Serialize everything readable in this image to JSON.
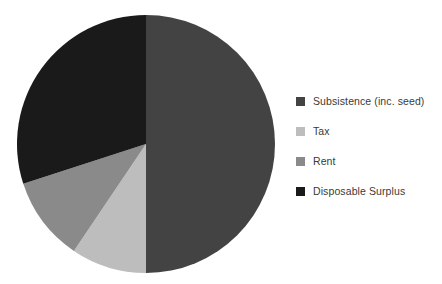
{
  "chart_data": {
    "type": "pie",
    "title": "",
    "subtitle": "",
    "xlabel": "",
    "ylabel": "",
    "grid": false,
    "legend_position": "right",
    "start_angle_deg": 0,
    "direction": "clockwise",
    "center": {
      "x": 146,
      "y": 144
    },
    "radius": 129,
    "labels": [
      "Subsistence (inc. seed)",
      "Tax",
      "Rent",
      "Disposable Surplus"
    ],
    "values": [
      50,
      9.5,
      10.5,
      30
    ],
    "unit": "percent",
    "colors": [
      "#434343",
      "#bdbdbd",
      "#8a8a8a",
      "#1a1a1a"
    ],
    "slices": [
      {
        "label": "Subsistence (inc. seed)",
        "value": 50,
        "color": "#434343",
        "start_deg": 0,
        "end_deg": 180
      },
      {
        "label": "Tax",
        "value": 9.5,
        "color": "#bdbdbd",
        "start_deg": 180,
        "end_deg": 214
      },
      {
        "label": "Rent",
        "value": 10.5,
        "color": "#8a8a8a",
        "start_deg": 214,
        "end_deg": 252
      },
      {
        "label": "Disposable Surplus",
        "value": 30,
        "color": "#1a1a1a",
        "start_deg": 252,
        "end_deg": 360
      }
    ]
  },
  "legend": {
    "items": [
      {
        "label": "Subsistence (inc. seed)",
        "color": "#434343"
      },
      {
        "label": "Tax",
        "color": "#bdbdbd"
      },
      {
        "label": "Rent",
        "color": "#8a8a8a"
      },
      {
        "label": "Disposable Surplus",
        "color": "#1a1a1a"
      }
    ]
  },
  "figure": {
    "background": "#ffffff",
    "text_color": "#3a3a3a"
  }
}
